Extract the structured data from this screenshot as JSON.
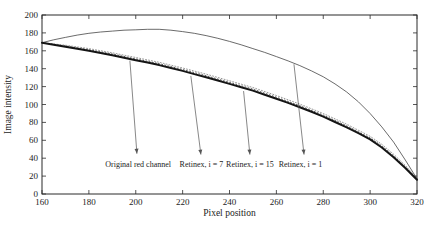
{
  "figure": {
    "background": "#ffffff"
  },
  "colors": {
    "axis": "#2b2b2b",
    "text": "#1c1c1c",
    "series_original": "#141414",
    "series_retinex1": "#3a3a3a",
    "series_retinex7": "#9a9a9a",
    "series_retinex15": "#5f5f5f",
    "arrow": "#555555"
  },
  "chart_data": {
    "type": "line",
    "title": "",
    "xlabel": "Pixel position",
    "ylabel": "Image intensity",
    "xlim": [
      160,
      320
    ],
    "ylim": [
      0,
      200
    ],
    "xticks": [
      160,
      180,
      200,
      220,
      240,
      260,
      280,
      300,
      320
    ],
    "yticks": [
      0,
      20,
      40,
      60,
      80,
      100,
      120,
      140,
      160,
      180,
      200
    ],
    "grid": false,
    "legend_position": "none",
    "series": [
      {
        "name": "Retinex, i = 7",
        "style": "dotted",
        "color": "#9a9a9a",
        "width": 1,
        "dash": "1,2",
        "x": [
          160,
          170,
          180,
          190,
          200,
          210,
          220,
          230,
          240,
          250,
          260,
          270,
          280,
          290,
          300,
          305,
          310,
          315,
          320
        ],
        "y": [
          169,
          166.3,
          162.5,
          157.8,
          152.5,
          147.2,
          140.8,
          134,
          126.5,
          119,
          110,
          100.5,
          90,
          78,
          64.5,
          55.5,
          44.5,
          32,
          17.5
        ]
      },
      {
        "name": "Retinex, i = 15",
        "style": "dotted",
        "color": "#5f5f5f",
        "width": 1,
        "dash": "1,2.2",
        "x": [
          160,
          170,
          180,
          190,
          200,
          210,
          220,
          230,
          240,
          250,
          260,
          270,
          280,
          290,
          300,
          305,
          310,
          315,
          320
        ],
        "y": [
          169,
          165.4,
          161.2,
          156.4,
          151,
          145.6,
          139.1,
          132.2,
          124.7,
          117.2,
          108.2,
          98.7,
          88.2,
          76.2,
          62.7,
          53.7,
          42.7,
          30.5,
          16.7
        ]
      },
      {
        "name": "Retinex, i = 1",
        "style": "thin-solid",
        "color": "#3a3a3a",
        "width": 0.75,
        "dash": "",
        "x": [
          160,
          165,
          170,
          175,
          180,
          185,
          190,
          195,
          200,
          205,
          210,
          215,
          220,
          225,
          230,
          235,
          240,
          245,
          250,
          255,
          260,
          265,
          270,
          275,
          280,
          285,
          290,
          295,
          300,
          305,
          310,
          315,
          320
        ],
        "y": [
          169,
          172.3,
          175,
          177.5,
          179.5,
          181,
          182,
          183,
          183.5,
          184,
          184,
          183,
          181.5,
          179.5,
          177,
          174,
          170.5,
          166.7,
          162.5,
          158.2,
          153.5,
          148.7,
          143.5,
          137.5,
          131,
          123,
          114,
          103,
          90,
          75,
          58,
          38,
          17
        ]
      },
      {
        "name": "Original red channel",
        "style": "thick-solid",
        "color": "#141414",
        "width": 2,
        "dash": "",
        "x": [
          160,
          165,
          170,
          175,
          180,
          185,
          190,
          195,
          200,
          205,
          210,
          215,
          220,
          225,
          230,
          235,
          240,
          245,
          250,
          255,
          260,
          265,
          270,
          275,
          280,
          285,
          290,
          295,
          300,
          305,
          310,
          315,
          320
        ],
        "y": [
          169,
          166.8,
          164.5,
          162.3,
          160,
          157.5,
          155,
          152.3,
          149.5,
          146.8,
          144,
          140.8,
          137.5,
          134,
          130.5,
          126.8,
          123,
          119.3,
          115.5,
          111,
          106.5,
          101.8,
          97,
          91.8,
          86.5,
          80.5,
          74.5,
          68,
          61,
          52,
          41,
          29,
          16
        ]
      }
    ],
    "annotations": [
      {
        "label": "Original red channel",
        "label_x": 201,
        "label_y": 33,
        "arrow_from_x": 197.5,
        "arrow_from_y": 149,
        "arrow_to_x": 200.5,
        "arrow_to_y": 45
      },
      {
        "label": "Retinex, i = 7",
        "label_x": 228,
        "label_y": 33,
        "arrow_from_x": 223.5,
        "arrow_from_y": 132,
        "arrow_to_x": 227.8,
        "arrow_to_y": 44
      },
      {
        "label": "Retinex, i = 15",
        "label_x": 248.7,
        "label_y": 33,
        "arrow_from_x": 246,
        "arrow_from_y": 115,
        "arrow_to_x": 248.7,
        "arrow_to_y": 44
      },
      {
        "label": "Retinex, i = 1",
        "label_x": 270.3,
        "label_y": 33,
        "arrow_from_x": 267.5,
        "arrow_from_y": 145,
        "arrow_to_x": 271.8,
        "arrow_to_y": 44
      }
    ]
  }
}
